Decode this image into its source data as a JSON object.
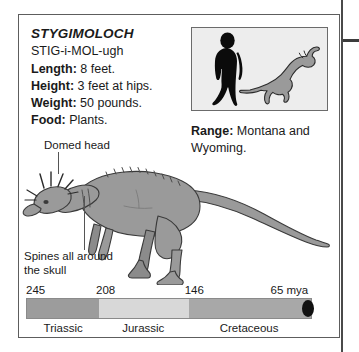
{
  "card": {
    "species_name": "STYGIMOLOCH",
    "pronunciation": "STIG-i-MOL-ugh",
    "stats": [
      {
        "label": "Length:",
        "value": " 8 feet."
      },
      {
        "label": "Height:",
        "value": " 3 feet at hips."
      },
      {
        "label": "Weight:",
        "value": " 50 pounds."
      },
      {
        "label": "Food:",
        "value": " Plants."
      }
    ],
    "range": {
      "label": "Range:",
      "value": " Montana and Wyoming."
    }
  },
  "scale_box": {
    "human_figure": "human-silhouette",
    "dinosaur_figure": "dinosaur-silhouette"
  },
  "annotations": [
    {
      "name": "domed-head",
      "text": "Domed head"
    },
    {
      "name": "spines",
      "text": "Spines all around the skull"
    }
  ],
  "illustration": {
    "subject": "stygimoloch-side-view"
  },
  "timeline": {
    "ticks": [
      {
        "label": "245",
        "left_pct": 0
      },
      {
        "label": "208",
        "left_pct": 24.5
      },
      {
        "label": "146",
        "left_pct": 55.5
      },
      {
        "label": "65 mya",
        "left_pct": 85.5
      }
    ],
    "segments": [
      {
        "name": "Triassic",
        "width_pct": 25.5,
        "color": "#9c9c9c"
      },
      {
        "name": "Jurassic",
        "width_pct": 31.5,
        "color": "#d8d8d8"
      },
      {
        "name": "Cretaceous",
        "width_pct": 43.0,
        "color": "#a8a8a8"
      }
    ],
    "periods": [
      {
        "label": "Triassic",
        "center_pct": 13
      },
      {
        "label": "Jurassic",
        "center_pct": 41
      },
      {
        "label": "Cretaceous",
        "center_pct": 78
      }
    ],
    "marker": {
      "name": "extinction-marker",
      "left_pct": 96.5,
      "color": "#111111"
    }
  }
}
